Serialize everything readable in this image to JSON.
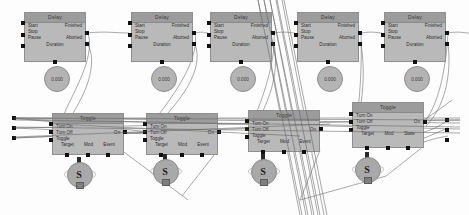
{
  "app": {
    "title": "Node Graph Editor",
    "canvas_background": "#fdfdfd",
    "node_fill": "#b9b9b9",
    "node_header_fill": "#9c9c9c",
    "wire_color": "#6f6f6f",
    "pin_color": "#111111"
  },
  "delay_nodes": [
    {
      "title": "Delay",
      "inputs": [
        "Start",
        "Stop",
        "Pause"
      ],
      "outputs": [
        "Finished",
        "Aborted"
      ],
      "footer": "Duration",
      "value": "0.000",
      "x": 24,
      "y": 12,
      "w": 62,
      "h": 50,
      "circle_x": 44,
      "circle_y": 66,
      "circle_d": 24
    },
    {
      "title": "Delay",
      "inputs": [
        "Start",
        "Stop",
        "Pause"
      ],
      "outputs": [
        "Finished",
        "Aborted"
      ],
      "footer": "Duration",
      "value": "0.000",
      "x": 131,
      "y": 12,
      "w": 62,
      "h": 50,
      "circle_x": 151,
      "circle_y": 66,
      "circle_d": 24
    },
    {
      "title": "Delay",
      "inputs": [
        "Start",
        "Stop",
        "Pause"
      ],
      "outputs": [
        "Finished",
        "Aborted"
      ],
      "footer": "Duration",
      "value": "0.000",
      "x": 210,
      "y": 12,
      "w": 62,
      "h": 50,
      "circle_x": 230,
      "circle_y": 66,
      "circle_d": 24
    },
    {
      "title": "Delay",
      "inputs": [
        "Start",
        "Stop",
        "Pause"
      ],
      "outputs": [
        "Finished",
        "Aborted"
      ],
      "footer": "Duration",
      "value": "0.000",
      "x": 297,
      "y": 12,
      "w": 62,
      "h": 50,
      "circle_x": 317,
      "circle_y": 66,
      "circle_d": 24
    },
    {
      "title": "Delay",
      "inputs": [
        "Start",
        "Stop",
        "Pause"
      ],
      "outputs": [
        "Finished",
        "Aborted"
      ],
      "footer": "Duration",
      "value": "0.000",
      "x": 384,
      "y": 12,
      "w": 62,
      "h": 50,
      "circle_x": 404,
      "circle_y": 66,
      "circle_d": 24
    }
  ],
  "toggle_nodes": [
    {
      "title": "Toggle",
      "inputs": [
        "Turn On",
        "Turn Off",
        "Toggle"
      ],
      "outputs": [
        "On"
      ],
      "bottom_pins": [
        "Target",
        "Mod",
        "Event"
      ],
      "x": 52,
      "y": 113,
      "w": 72,
      "h": 42,
      "switch_x": 64,
      "switch_y": 160
    },
    {
      "title": "Toggle",
      "inputs": [
        "Turn On",
        "Turn Off",
        "Toggle"
      ],
      "outputs": [
        "On"
      ],
      "bottom_pins": [
        "Target",
        "Mod",
        "Event"
      ],
      "x": 146,
      "y": 113,
      "w": 72,
      "h": 42,
      "switch_x": 158,
      "switch_y": 158
    },
    {
      "title": "Toggle",
      "inputs": [
        "Turn On",
        "Turn Off",
        "Toggle"
      ],
      "outputs": [
        "On"
      ],
      "bottom_pins": [
        "Target",
        "Mod",
        "Event"
      ],
      "x": 248,
      "y": 110,
      "w": 72,
      "h": 42,
      "switch_x": 248,
      "switch_y": 158
    },
    {
      "title": "Toggle",
      "inputs": [
        "Turn On",
        "Turn Off",
        "Toggle"
      ],
      "outputs": [
        "On"
      ],
      "bottom_pins": [
        "Target",
        "Mod",
        "State"
      ],
      "x": 352,
      "y": 102,
      "w": 72,
      "h": 46,
      "switch_x": 352,
      "switch_y": 156
    }
  ],
  "switch_glyph": "S",
  "free_pins": [
    {
      "x": 12,
      "y": 116
    },
    {
      "x": 12,
      "y": 126
    },
    {
      "x": 12,
      "y": 136
    }
  ]
}
